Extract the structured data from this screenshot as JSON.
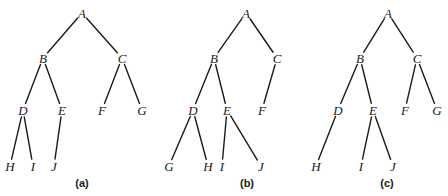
{
  "diagram": {
    "trees": [
      {
        "caption": "(a)",
        "caption_pos": [
          82,
          187
        ],
        "nodes": [
          {
            "id": "A",
            "label": "A",
            "x": 82,
            "y": 13
          },
          {
            "id": "B",
            "label": "B",
            "x": 43,
            "y": 58
          },
          {
            "id": "C",
            "label": "C",
            "x": 122,
            "y": 58
          },
          {
            "id": "D",
            "label": "D",
            "x": 23,
            "y": 110
          },
          {
            "id": "E",
            "label": "E",
            "x": 62,
            "y": 110
          },
          {
            "id": "F",
            "label": "F",
            "x": 102,
            "y": 110
          },
          {
            "id": "G",
            "label": "G",
            "x": 142,
            "y": 110
          },
          {
            "id": "H",
            "label": "H",
            "x": 10,
            "y": 166
          },
          {
            "id": "I",
            "label": "I",
            "x": 33,
            "y": 166
          },
          {
            "id": "J",
            "label": "J",
            "x": 54,
            "y": 166
          }
        ],
        "edges": [
          [
            "A",
            "B"
          ],
          [
            "A",
            "C"
          ],
          [
            "B",
            "D"
          ],
          [
            "B",
            "E"
          ],
          [
            "C",
            "F"
          ],
          [
            "C",
            "G"
          ],
          [
            "D",
            "H"
          ],
          [
            "D",
            "I"
          ],
          [
            "E",
            "J"
          ]
        ]
      },
      {
        "caption": "(b)",
        "caption_pos": [
          247,
          187
        ],
        "nodes": [
          {
            "id": "A",
            "label": "A",
            "x": 246,
            "y": 13
          },
          {
            "id": "B",
            "label": "B",
            "x": 214,
            "y": 58
          },
          {
            "id": "C",
            "label": "C",
            "x": 277,
            "y": 58
          },
          {
            "id": "D",
            "label": "D",
            "x": 193,
            "y": 110
          },
          {
            "id": "E",
            "label": "E",
            "x": 227,
            "y": 110
          },
          {
            "id": "F",
            "label": "F",
            "x": 262,
            "y": 110
          },
          {
            "id": "G",
            "label": "G",
            "x": 169,
            "y": 166
          },
          {
            "id": "H",
            "label": "H",
            "x": 208,
            "y": 166
          },
          {
            "id": "I",
            "label": "I",
            "x": 222,
            "y": 166
          },
          {
            "id": "J",
            "label": "J",
            "x": 261,
            "y": 166
          }
        ],
        "edges": [
          [
            "A",
            "B"
          ],
          [
            "A",
            "C"
          ],
          [
            "B",
            "D"
          ],
          [
            "B",
            "E"
          ],
          [
            "C",
            "F"
          ],
          [
            "D",
            "G"
          ],
          [
            "D",
            "H"
          ],
          [
            "E",
            "I"
          ],
          [
            "E",
            "J"
          ]
        ]
      },
      {
        "caption": "(c)",
        "caption_pos": [
          387,
          187
        ],
        "nodes": [
          {
            "id": "A",
            "label": "A",
            "x": 388,
            "y": 13
          },
          {
            "id": "B",
            "label": "B",
            "x": 360,
            "y": 58
          },
          {
            "id": "C",
            "label": "C",
            "x": 417,
            "y": 58
          },
          {
            "id": "D",
            "label": "D",
            "x": 338,
            "y": 110
          },
          {
            "id": "E",
            "label": "E",
            "x": 373,
            "y": 110
          },
          {
            "id": "F",
            "label": "F",
            "x": 405,
            "y": 110
          },
          {
            "id": "G",
            "label": "G",
            "x": 437,
            "y": 110
          },
          {
            "id": "H",
            "label": "H",
            "x": 316,
            "y": 166
          },
          {
            "id": "I",
            "label": "I",
            "x": 361,
            "y": 166
          },
          {
            "id": "J",
            "label": "J",
            "x": 393,
            "y": 166
          }
        ],
        "edges": [
          [
            "A",
            "B"
          ],
          [
            "A",
            "C"
          ],
          [
            "B",
            "D"
          ],
          [
            "B",
            "E"
          ],
          [
            "C",
            "F"
          ],
          [
            "C",
            "G"
          ],
          [
            "D",
            "H"
          ],
          [
            "E",
            "I"
          ],
          [
            "E",
            "J"
          ]
        ]
      }
    ],
    "colors": {
      "line": "#1a1a1a",
      "background": "#ffffff"
    }
  }
}
